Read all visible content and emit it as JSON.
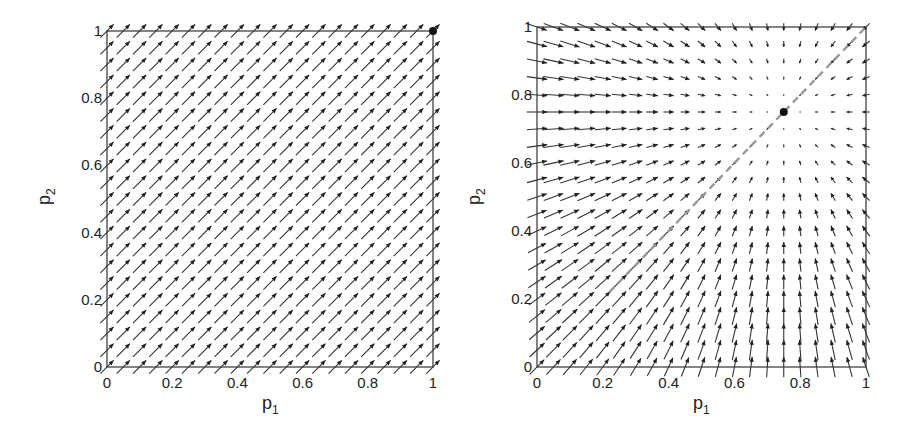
{
  "chart_data": [
    {
      "type": "quiver",
      "title": "",
      "xlabel": "p_1",
      "ylabel": "p_2",
      "xlim": [
        0,
        1
      ],
      "ylim": [
        0,
        1
      ],
      "xticks": [
        "0",
        "0.2",
        "0.4",
        "0.6",
        "0.8",
        "1"
      ],
      "yticks": [
        "0",
        "0.2",
        "0.4",
        "0.6",
        "0.8",
        "1"
      ],
      "grid": false,
      "grid_step": 0.05,
      "grid_points_per_axis": 21,
      "vector_field": "uniform direction (1,1): all arrows point diagonally up-right with equal length",
      "field_direction": [
        1,
        1
      ],
      "equilibrium_point": {
        "p1": 1.0,
        "p2": 1.0,
        "marker": "filled black dot"
      },
      "diagonal_dashed_line": null
    },
    {
      "type": "quiver",
      "title": "",
      "xlabel": "p_1",
      "ylabel": "p_2",
      "xlim": [
        0,
        1
      ],
      "ylim": [
        0,
        1
      ],
      "xticks": [
        "0",
        "0.2",
        "0.4",
        "0.6",
        "0.8",
        "1"
      ],
      "yticks": [
        "0",
        "0.2",
        "0.4",
        "0.6",
        "0.8",
        "1"
      ],
      "grid": false,
      "grid_step": 0.05,
      "grid_points_per_axis": 21,
      "vector_field": "converging field: arrows point toward equilibrium (0.75, 0.75); length proportional to distance from it",
      "field_target": [
        0.75,
        0.75
      ],
      "equilibrium_point": {
        "p1": 0.75,
        "p2": 0.75,
        "marker": "filled black dot"
      },
      "diagonal_dashed_line": {
        "from": [
          0.22,
          0.22
        ],
        "to": [
          1.0,
          1.0
        ],
        "color": "#999999",
        "style": "dashed"
      }
    }
  ],
  "panels": [
    {
      "id": "left",
      "xlabel_main": "p",
      "xlabel_sub": "1",
      "ylabel_main": "p",
      "ylabel_sub": "2"
    },
    {
      "id": "right",
      "xlabel_main": "p",
      "xlabel_sub": "1",
      "ylabel_main": "p",
      "ylabel_sub": "2"
    }
  ]
}
